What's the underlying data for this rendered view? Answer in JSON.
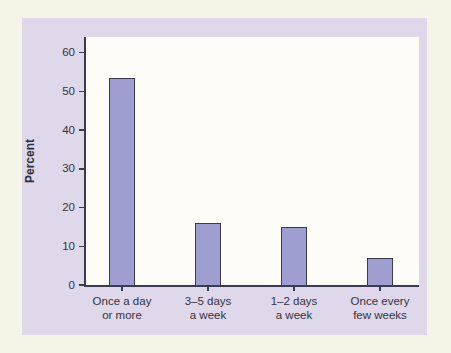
{
  "chart_data": {
    "type": "bar",
    "ylabel": "Percent",
    "categories": [
      [
        "Once a day",
        "or more"
      ],
      [
        "3–5 days",
        "a week"
      ],
      [
        "1–2 days",
        "a week"
      ],
      [
        "Once every",
        "few weeks"
      ]
    ],
    "values": [
      53.5,
      16,
      15,
      7
    ],
    "yticks": [
      0,
      10,
      20,
      30,
      40,
      50,
      60
    ],
    "ylim": [
      0,
      64
    ],
    "grid": false,
    "legend": "none",
    "colors": {
      "page_background": "#f4f5e7",
      "panel_background": "#ded8ea",
      "plot_background": "#fdfcf7",
      "bar_fill": "#9e9ed0",
      "bar_border": "#3a3a50",
      "axis": "#3a3a50",
      "text": "#33333d"
    }
  }
}
